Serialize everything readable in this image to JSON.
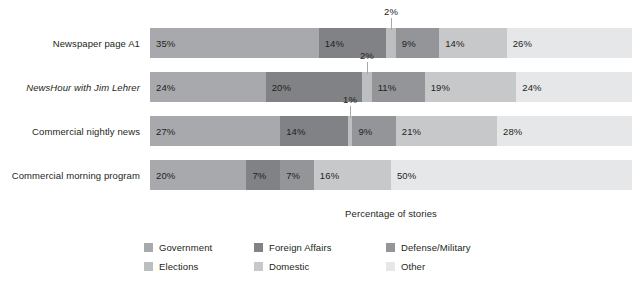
{
  "chart_data": {
    "type": "bar",
    "title": "",
    "subtitle": "",
    "xlabel": "Percentage of stories",
    "ylabel": "",
    "orientation": "horizontal",
    "stacked": true,
    "normalized_percent": true,
    "xlim": [
      0,
      100
    ],
    "grid": false,
    "legend_position": "bottom",
    "legend_columns": 3,
    "categories": [
      "Newspaper page A1",
      "NewsHour with Jim Lehrer",
      "Commercial nightly news",
      "Commercial morning program"
    ],
    "category_styles": [
      "normal",
      "italic",
      "normal",
      "normal"
    ],
    "series": [
      {
        "name": "Government",
        "color": "#a7a9ac",
        "values": [
          35,
          24,
          27,
          20
        ]
      },
      {
        "name": "Foreign Affairs",
        "color": "#808285",
        "values": [
          14,
          20,
          14,
          7
        ]
      },
      {
        "name": "Elections",
        "color": "#bcbec0",
        "values": [
          2,
          2,
          1,
          0
        ]
      },
      {
        "name": "Defense/Military",
        "color": "#939598",
        "values": [
          9,
          11,
          9,
          7
        ]
      },
      {
        "name": "Domestic",
        "color": "#c7c8ca",
        "values": [
          14,
          19,
          21,
          16
        ]
      },
      {
        "name": "Other",
        "color": "#e6e7e8",
        "values": [
          26,
          24,
          28,
          50
        ]
      }
    ],
    "bar_labels": [
      [
        "35%",
        "14%",
        "2%",
        "9%",
        "14%",
        "26%"
      ],
      [
        "24%",
        "20%",
        "2%",
        "11%",
        "19%",
        "24%"
      ],
      [
        "27%",
        "14%",
        "1%",
        "9%",
        "21%",
        "28%"
      ],
      [
        "20%",
        "7%",
        "",
        "7%",
        "16%",
        "50%"
      ]
    ],
    "callouts": [
      {
        "row": 0,
        "series": "Elections",
        "label": "2%"
      },
      {
        "row": 1,
        "series": "Elections",
        "label": "2%"
      },
      {
        "row": 2,
        "series": "Elections",
        "label": "1%"
      }
    ],
    "colors": {
      "government": "#a7a9ac",
      "foreign_affairs": "#808285",
      "elections": "#bcbec0",
      "defense_military": "#939598",
      "domestic": "#c7c8ca",
      "other": "#e6e7e8",
      "text": "#231f20",
      "leader_line": "#a6a8ab",
      "background": "#ffffff"
    }
  }
}
